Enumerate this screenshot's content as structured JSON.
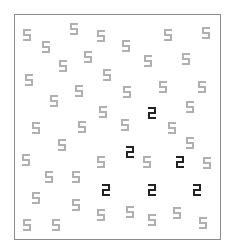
{
  "task": {
    "type": "visual-search",
    "target_digit": "2",
    "distractor_digit": "5"
  },
  "colors": {
    "frame": "#8c8c8c",
    "distractor": "#b0b0b0",
    "target": "#222222",
    "background": "#ffffff"
  },
  "frame": {
    "left": 14,
    "top": 14,
    "right": 220,
    "bottom": 239
  },
  "glyphs": {
    "distractors": [
      [
        27,
        35
      ],
      [
        46,
        47
      ],
      [
        74,
        29
      ],
      [
        101,
        36
      ],
      [
        88,
        57
      ],
      [
        63,
        66
      ],
      [
        126,
        46
      ],
      [
        148,
        61
      ],
      [
        168,
        35
      ],
      [
        186,
        59
      ],
      [
        206,
        33
      ],
      [
        29,
        80
      ],
      [
        107,
        75
      ],
      [
        79,
        91
      ],
      [
        54,
        101
      ],
      [
        103,
        112
      ],
      [
        127,
        92
      ],
      [
        163,
        87
      ],
      [
        202,
        87
      ],
      [
        190,
        107
      ],
      [
        36,
        128
      ],
      [
        82,
        127
      ],
      [
        62,
        145
      ],
      [
        26,
        160
      ],
      [
        101,
        162
      ],
      [
        125,
        125
      ],
      [
        172,
        128
      ],
      [
        190,
        143
      ],
      [
        147,
        162
      ],
      [
        207,
        163
      ],
      [
        49,
        177
      ],
      [
        76,
        177
      ],
      [
        36,
        198
      ],
      [
        76,
        205
      ],
      [
        101,
        215
      ],
      [
        27,
        225
      ],
      [
        56,
        225
      ],
      [
        130,
        212
      ],
      [
        152,
        220
      ],
      [
        177,
        213
      ],
      [
        203,
        223
      ]
    ],
    "targets": [
      [
        152,
        113
      ],
      [
        130,
        152
      ],
      [
        180,
        162
      ],
      [
        106,
        190
      ],
      [
        152,
        190
      ],
      [
        197,
        190
      ]
    ]
  }
}
